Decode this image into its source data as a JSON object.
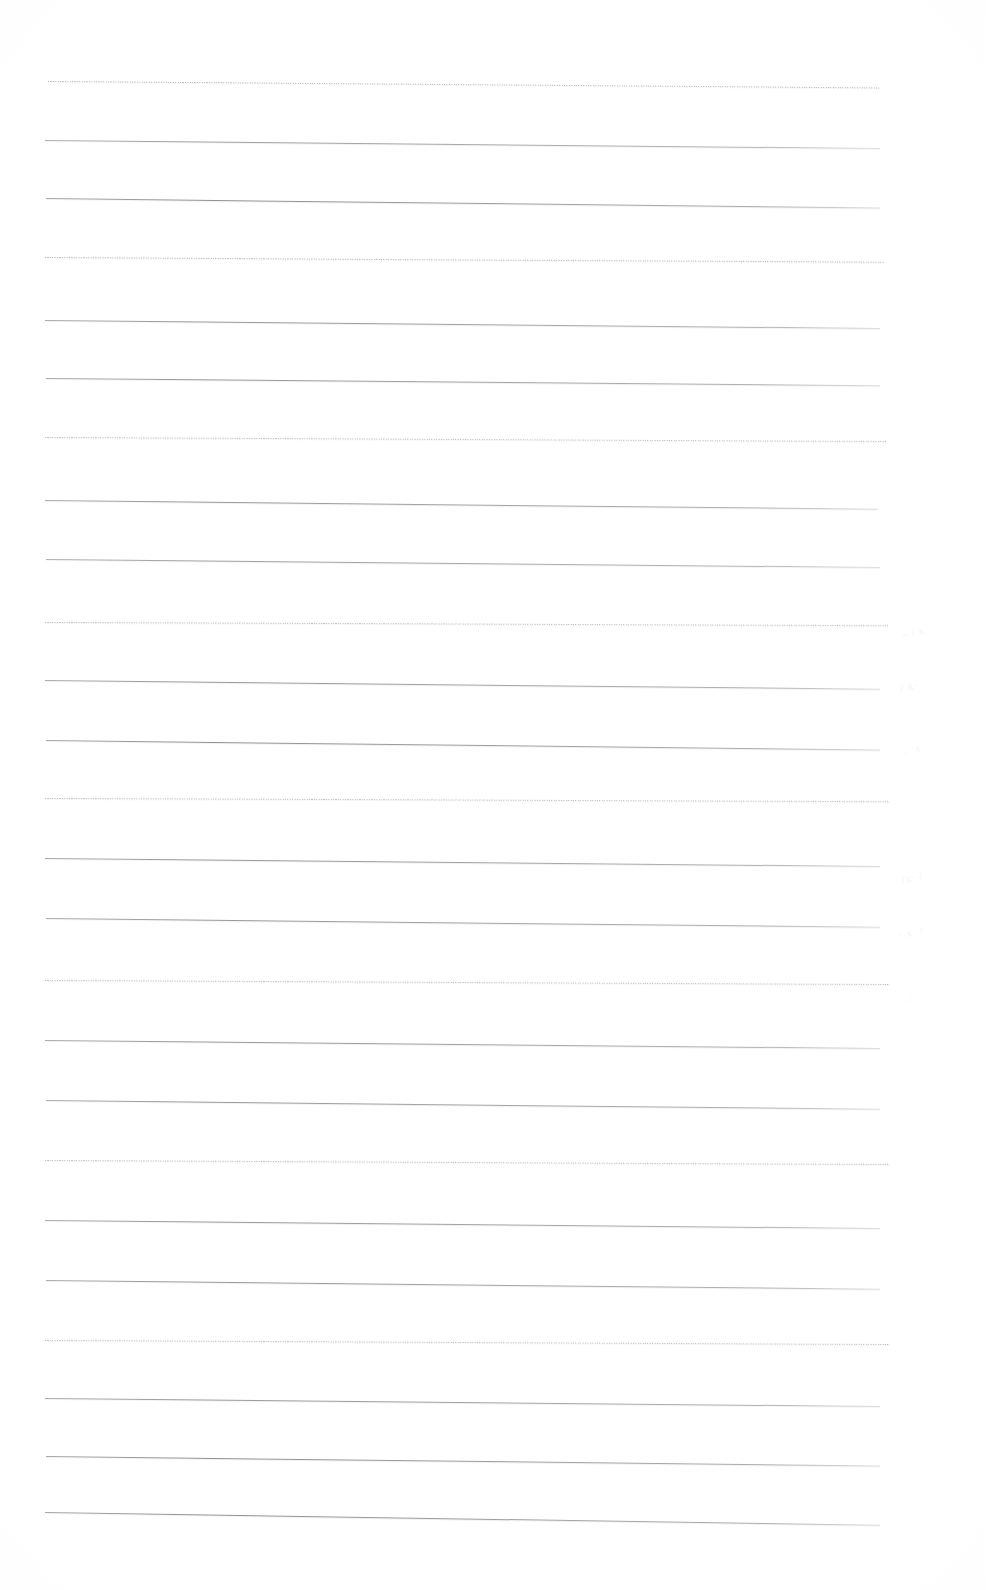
{
  "document": {
    "kind": "scanned-ruled-notebook-page",
    "title": "Blank Ruled Notebook Page",
    "page_width": 986,
    "page_height": 1590,
    "background_color": "#fefefe",
    "content_text": "",
    "note": "No legible text content is present on the page."
  },
  "ruling": {
    "line_color_dark": "#6d6f74",
    "line_color_light": "#a0a2a8",
    "left_margin_x": 48,
    "right_margin_x": 880,
    "first_line_y": 81,
    "line_spacing": 58,
    "line_count": 25,
    "lines": [
      {
        "y": 81,
        "x_start": 48,
        "x_end": 880,
        "texture": "dotted",
        "slant": 0.8,
        "opacity": 0.55
      },
      {
        "y": 140,
        "x_start": 45,
        "x_end": 880,
        "texture": "solid",
        "slant": 1.0,
        "opacity": 0.75
      },
      {
        "y": 198,
        "x_start": 46,
        "x_end": 880,
        "texture": "solid",
        "slant": 1.2,
        "opacity": 0.85
      },
      {
        "y": 257,
        "x_start": 45,
        "x_end": 884,
        "texture": "dotted",
        "slant": 0.6,
        "opacity": 0.55
      },
      {
        "y": 320,
        "x_start": 45,
        "x_end": 880,
        "texture": "solid",
        "slant": 1.0,
        "opacity": 0.8
      },
      {
        "y": 378,
        "x_start": 46,
        "x_end": 880,
        "texture": "solid",
        "slant": 0.9,
        "opacity": 0.8
      },
      {
        "y": 437,
        "x_start": 45,
        "x_end": 886,
        "texture": "dotted",
        "slant": 0.5,
        "opacity": 0.5
      },
      {
        "y": 500,
        "x_start": 45,
        "x_end": 878,
        "texture": "solid",
        "slant": 1.1,
        "opacity": 0.8
      },
      {
        "y": 559,
        "x_start": 46,
        "x_end": 880,
        "texture": "solid",
        "slant": 1.0,
        "opacity": 0.75
      },
      {
        "y": 622,
        "x_start": 45,
        "x_end": 888,
        "texture": "dotted",
        "slant": 0.4,
        "opacity": 0.5
      },
      {
        "y": 680,
        "x_start": 45,
        "x_end": 880,
        "texture": "solid",
        "slant": 1.1,
        "opacity": 0.8
      },
      {
        "y": 740,
        "x_start": 46,
        "x_end": 880,
        "texture": "solid",
        "slant": 1.2,
        "opacity": 0.85
      },
      {
        "y": 798,
        "x_start": 45,
        "x_end": 890,
        "texture": "dotted",
        "slant": 0.4,
        "opacity": 0.5
      },
      {
        "y": 858,
        "x_start": 45,
        "x_end": 880,
        "texture": "solid",
        "slant": 1.0,
        "opacity": 0.8
      },
      {
        "y": 918,
        "x_start": 46,
        "x_end": 880,
        "texture": "solid",
        "slant": 1.1,
        "opacity": 0.8
      },
      {
        "y": 980,
        "x_start": 45,
        "x_end": 890,
        "texture": "dotted",
        "slant": 0.5,
        "opacity": 0.5
      },
      {
        "y": 1040,
        "x_start": 45,
        "x_end": 880,
        "texture": "solid",
        "slant": 1.0,
        "opacity": 0.8
      },
      {
        "y": 1100,
        "x_start": 46,
        "x_end": 880,
        "texture": "solid",
        "slant": 1.1,
        "opacity": 0.8
      },
      {
        "y": 1160,
        "x_start": 45,
        "x_end": 890,
        "texture": "dotted",
        "slant": 0.5,
        "opacity": 0.5
      },
      {
        "y": 1220,
        "x_start": 45,
        "x_end": 880,
        "texture": "solid",
        "slant": 1.0,
        "opacity": 0.8
      },
      {
        "y": 1280,
        "x_start": 46,
        "x_end": 880,
        "texture": "solid",
        "slant": 1.1,
        "opacity": 0.8
      },
      {
        "y": 1340,
        "x_start": 45,
        "x_end": 890,
        "texture": "dotted",
        "slant": 0.5,
        "opacity": 0.5
      },
      {
        "y": 1398,
        "x_start": 45,
        "x_end": 880,
        "texture": "solid",
        "slant": 1.0,
        "opacity": 0.8
      },
      {
        "y": 1456,
        "x_start": 46,
        "x_end": 880,
        "texture": "solid",
        "slant": 1.2,
        "opacity": 0.85
      },
      {
        "y": 1512,
        "x_start": 45,
        "x_end": 880,
        "texture": "solid",
        "slant": 1.6,
        "opacity": 0.85
      }
    ]
  },
  "margin_marks": {
    "description": "Extremely faint illegible pencil traces in the right margin",
    "color": "#e9eaec",
    "items": [
      {
        "x": 902,
        "y": 630,
        "glyph": "~ / x",
        "rotate": -14,
        "size": 10,
        "opacity": 0.5
      },
      {
        "x": 900,
        "y": 683,
        "glyph": "/ x́·",
        "rotate": -16,
        "size": 11,
        "opacity": 0.55
      },
      {
        "x": 904,
        "y": 745,
        "glyph": ", ·x",
        "rotate": -10,
        "size": 10,
        "opacity": 0.45
      },
      {
        "x": 902,
        "y": 874,
        "glyph": "/x· /",
        "rotate": -12,
        "size": 10,
        "opacity": 0.5
      },
      {
        "x": 899,
        "y": 930,
        "glyph": "· x ·/",
        "rotate": -14,
        "size": 10,
        "opacity": 0.5
      },
      {
        "x": 905,
        "y": 995,
        "glyph": "·/",
        "rotate": -10,
        "size": 9,
        "opacity": 0.4
      }
    ]
  }
}
